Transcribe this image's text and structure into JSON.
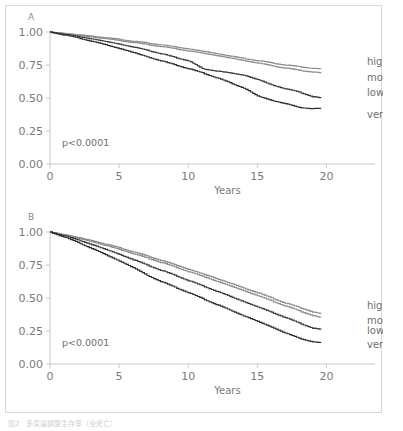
{
  "figure": {
    "caption": "図2　多変量調整生存率（全死亡）",
    "panels": [
      {
        "id": "A",
        "letter": "A",
        "pvalue": "p<0.0001",
        "xlabel": "Years",
        "xticks": [
          "0",
          "5",
          "10",
          "15",
          "20"
        ],
        "yticks": [
          "0.00",
          "0.25",
          "0.50",
          "0.75",
          "1.00"
        ],
        "legend": [
          "high",
          "moderate",
          "low",
          "very low"
        ]
      },
      {
        "id": "B",
        "letter": "B",
        "pvalue": "p<0.0001",
        "xlabel": "Years",
        "xticks": [
          "0",
          "5",
          "10",
          "15",
          "20"
        ],
        "yticks": [
          "0.00",
          "0.25",
          "0.50",
          "0.75",
          "1.00"
        ],
        "legend": [
          "high",
          "moderate",
          "low",
          "very low"
        ]
      }
    ]
  },
  "chart_data": [
    {
      "type": "line",
      "panel": "A",
      "title": "A",
      "xlabel": "Years",
      "ylabel": "",
      "xlim": [
        0,
        22.5
      ],
      "ylim": [
        0.0,
        1.0
      ],
      "xticks": [
        0,
        5,
        10,
        15,
        20
      ],
      "yticks": [
        0.0,
        0.25,
        0.5,
        0.75,
        1.0
      ],
      "grid": false,
      "legend_position": "right",
      "annotations": [
        "p<0.0001"
      ],
      "x": [
        0,
        1,
        2,
        3,
        4,
        5,
        6,
        7,
        8,
        9,
        10,
        11,
        12,
        13,
        14,
        15,
        16,
        17,
        18,
        19,
        19.6
      ],
      "series": [
        {
          "name": "high",
          "color": "#8c8c8c",
          "values": [
            1.0,
            0.99,
            0.979,
            0.968,
            0.957,
            0.944,
            0.93,
            0.917,
            0.903,
            0.888,
            0.872,
            0.855,
            0.837,
            0.818,
            0.8,
            0.783,
            0.766,
            0.75,
            0.737,
            0.725,
            0.72
          ]
        },
        {
          "name": "moderate",
          "color": "#8c8c8c",
          "values": [
            1.0,
            0.988,
            0.975,
            0.962,
            0.949,
            0.935,
            0.92,
            0.905,
            0.89,
            0.874,
            0.857,
            0.84,
            0.822,
            0.803,
            0.784,
            0.765,
            0.745,
            0.727,
            0.71,
            0.697,
            0.69
          ]
        },
        {
          "name": "low",
          "color": "#3a3a3a",
          "values": [
            1.0,
            0.983,
            0.966,
            0.948,
            0.928,
            0.908,
            0.886,
            0.862,
            0.836,
            0.808,
            0.782,
            0.722,
            0.705,
            0.69,
            0.673,
            0.64,
            0.6,
            0.57,
            0.545,
            0.51,
            0.5
          ]
        },
        {
          "name": "very low",
          "color": "#2b2b2b",
          "values": [
            1.0,
            0.978,
            0.955,
            0.93,
            0.903,
            0.875,
            0.845,
            0.812,
            0.782,
            0.752,
            0.722,
            0.69,
            0.655,
            0.615,
            0.575,
            0.515,
            0.482,
            0.458,
            0.428,
            0.42,
            0.42
          ]
        }
      ]
    },
    {
      "type": "line",
      "panel": "B",
      "title": "B",
      "xlabel": "Years",
      "ylabel": "",
      "xlim": [
        0,
        22.5
      ],
      "ylim": [
        0.0,
        1.0
      ],
      "xticks": [
        0,
        5,
        10,
        15,
        20
      ],
      "yticks": [
        0.0,
        0.25,
        0.5,
        0.75,
        1.0
      ],
      "grid": false,
      "legend_position": "right",
      "annotations": [
        "p<0.0001"
      ],
      "x": [
        0,
        1,
        2,
        3,
        4,
        5,
        6,
        7,
        8,
        9,
        10,
        11,
        12,
        13,
        14,
        15,
        16,
        17,
        18,
        19,
        19.6
      ],
      "series": [
        {
          "name": "high",
          "color": "#8c8c8c",
          "values": [
            1.0,
            0.98,
            0.958,
            0.935,
            0.908,
            0.88,
            0.85,
            0.818,
            0.786,
            0.752,
            0.718,
            0.683,
            0.648,
            0.612,
            0.575,
            0.54,
            0.5,
            0.462,
            0.428,
            0.395,
            0.38
          ]
        },
        {
          "name": "moderate",
          "color": "#8c8c8c",
          "values": [
            1.0,
            0.978,
            0.953,
            0.927,
            0.898,
            0.868,
            0.836,
            0.803,
            0.77,
            0.735,
            0.7,
            0.665,
            0.628,
            0.592,
            0.555,
            0.518,
            0.478,
            0.44,
            0.403,
            0.368,
            0.35
          ]
        },
        {
          "name": "low",
          "color": "#3a3a3a",
          "values": [
            1.0,
            0.972,
            0.94,
            0.905,
            0.868,
            0.83,
            0.79,
            0.75,
            0.71,
            0.672,
            0.632,
            0.592,
            0.552,
            0.512,
            0.472,
            0.432,
            0.392,
            0.352,
            0.31,
            0.272,
            0.26
          ]
        },
        {
          "name": "very low",
          "color": "#2b2b2b",
          "values": [
            1.0,
            0.962,
            0.92,
            0.875,
            0.828,
            0.78,
            0.73,
            0.672,
            0.625,
            0.582,
            0.54,
            0.495,
            0.452,
            0.408,
            0.365,
            0.322,
            0.28,
            0.235,
            0.195,
            0.168,
            0.16
          ]
        }
      ]
    }
  ]
}
